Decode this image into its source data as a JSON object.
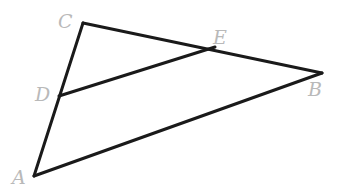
{
  "figure": {
    "type": "geometry-diagram",
    "background_color": "#ffffff",
    "stroke_color": "#1a1a1a",
    "stroke_width": 3,
    "label_color": "#b9b9b9",
    "width": 347,
    "height": 195,
    "points": [
      {
        "id": "A",
        "label": "A",
        "x": 34,
        "y": 176,
        "label_x": 12,
        "label_y": 168
      },
      {
        "id": "B",
        "label": "B",
        "x": 322,
        "y": 73,
        "label_x": 308,
        "label_y": 80
      },
      {
        "id": "C",
        "label": "C",
        "x": 83,
        "y": 23,
        "label_x": 58,
        "label_y": 12
      },
      {
        "id": "D",
        "label": "D",
        "x": 59,
        "y": 96,
        "label_x": 35,
        "label_y": 85
      },
      {
        "id": "E",
        "label": "E",
        "x": 206,
        "y": 49,
        "label_x": 213,
        "label_y": 28
      }
    ],
    "segments": [
      {
        "id": "CA",
        "from": "C",
        "to": "A",
        "via": "D",
        "path": "M 83 23 L 34 176"
      },
      {
        "id": "CB",
        "from": "C",
        "to": "B",
        "via": "E",
        "path": "M 83 23 L 322 73"
      },
      {
        "id": "AB",
        "from": "A",
        "to": "B",
        "path": "M 34 176 L 322 73"
      },
      {
        "id": "DE",
        "from": "D",
        "to": "E",
        "path": "M 59 96 L 215 47"
      }
    ]
  }
}
